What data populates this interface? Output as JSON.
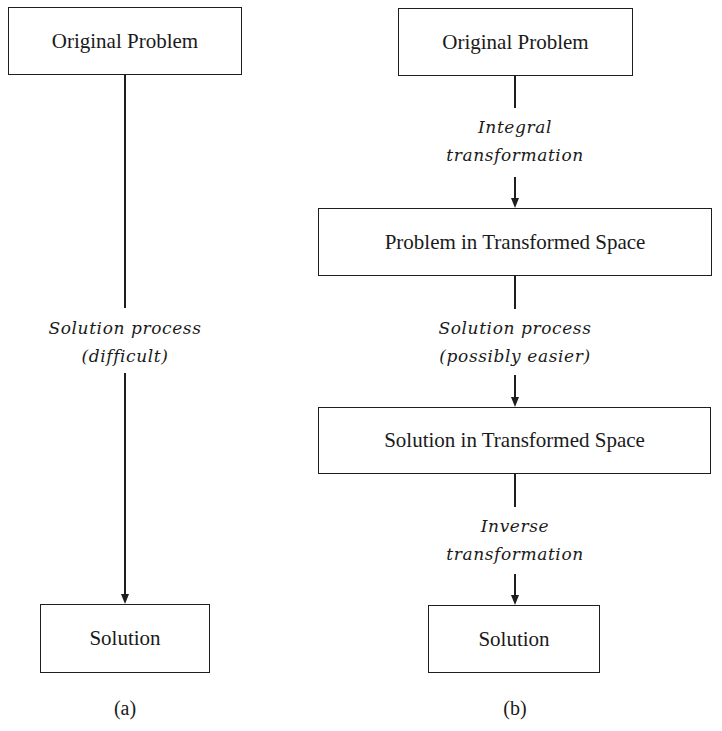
{
  "panel_a": {
    "caption": "(a)",
    "boxes": [
      {
        "label": "Original Problem"
      },
      {
        "label": "Solution"
      }
    ],
    "edges": [
      {
        "line1": "Solution process",
        "line2": "(difficult)"
      }
    ]
  },
  "panel_b": {
    "caption": "(b)",
    "boxes": [
      {
        "label": "Original Problem"
      },
      {
        "label": "Problem in Transformed Space"
      },
      {
        "label": "Solution in Transformed Space"
      },
      {
        "label": "Solution"
      }
    ],
    "edges": [
      {
        "line1": "Integral",
        "line2": "transformation"
      },
      {
        "line1": "Solution process",
        "line2": "(possibly easier)"
      },
      {
        "line1": "Inverse",
        "line2": "transformation"
      }
    ]
  },
  "colors": {
    "stroke": "#1e1e1e",
    "background": "#ffffff",
    "text": "#1a1a1a"
  }
}
